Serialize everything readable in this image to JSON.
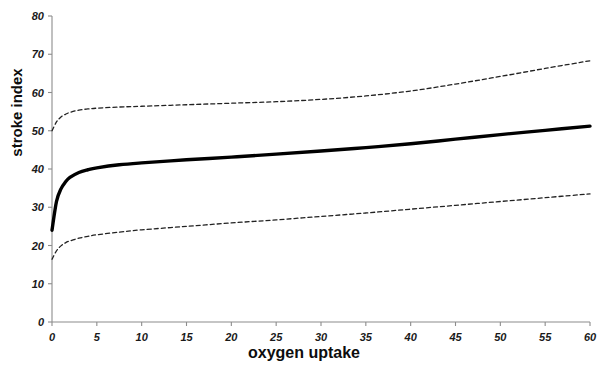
{
  "chart_data": {
    "type": "line",
    "title": "",
    "xlabel": "oxygen uptake",
    "ylabel": "stroke index",
    "xlim": [
      0,
      60
    ],
    "ylim": [
      0,
      80
    ],
    "grid": false,
    "legend": "none",
    "xticks": [
      "0",
      "5",
      "10",
      "15",
      "20",
      "25",
      "30",
      "35",
      "40",
      "45",
      "50",
      "55",
      "60"
    ],
    "yticks": [
      "0",
      "10",
      "20",
      "30",
      "40",
      "50",
      "60",
      "70",
      "80"
    ],
    "x": [
      0,
      0.5,
      1,
      1.5,
      2,
      3,
      4,
      5,
      7.5,
      10,
      15,
      20,
      25,
      30,
      35,
      40,
      45,
      50,
      55,
      60
    ],
    "series": [
      {
        "name": "upper confidence limit",
        "style": "dashed",
        "color": "#222222",
        "values": [
          50.0,
          52.3,
          53.6,
          54.3,
          54.8,
          55.4,
          55.7,
          55.9,
          56.2,
          56.4,
          56.8,
          57.2,
          57.6,
          58.2,
          59.1,
          60.4,
          62.2,
          64.2,
          66.3,
          68.3
        ]
      },
      {
        "name": "fitted curve",
        "style": "solid",
        "color": "#000000",
        "values": [
          24.0,
          31.5,
          34.8,
          36.6,
          37.8,
          39.1,
          39.8,
          40.3,
          41.1,
          41.6,
          42.4,
          43.1,
          43.9,
          44.7,
          45.6,
          46.6,
          47.8,
          49.0,
          50.1,
          51.2
        ]
      },
      {
        "name": "lower confidence limit",
        "style": "dashed",
        "color": "#222222",
        "values": [
          16.4,
          18.6,
          19.9,
          20.7,
          21.2,
          21.9,
          22.4,
          22.8,
          23.5,
          24.1,
          25.0,
          25.9,
          26.7,
          27.6,
          28.5,
          29.5,
          30.5,
          31.5,
          32.5,
          33.5
        ]
      }
    ],
    "axis": {
      "color": "#8c8c8c",
      "tick_length": 4,
      "origin_px": {
        "x": 52,
        "y": 322
      },
      "x_end_px": 590,
      "y_top_px": 16
    }
  }
}
